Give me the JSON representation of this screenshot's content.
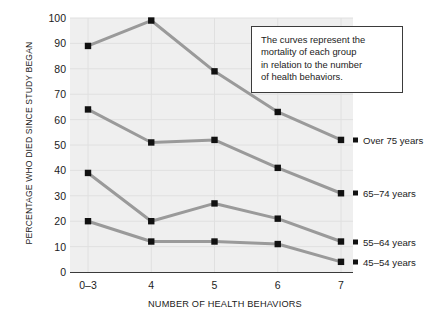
{
  "chart_data": {
    "type": "line",
    "title": "",
    "xlabel": "NUMBER OF HEALTH BEHAVIORS",
    "ylabel": "PERCENTAGE WHO DIED SINCE STUDY BEGAN",
    "categories": [
      "0–3",
      "4",
      "5",
      "6",
      "7"
    ],
    "ylim": [
      0,
      100
    ],
    "yticks": [
      0,
      10,
      20,
      30,
      40,
      50,
      60,
      70,
      80,
      90,
      100
    ],
    "grid": true,
    "legend_position": "inline-right-end-of-series",
    "marker": "square",
    "series": [
      {
        "name": "Over 75 years",
        "values": [
          89,
          99,
          79,
          63,
          52
        ]
      },
      {
        "name": "65–74 years",
        "values": [
          64,
          51,
          52,
          41,
          31
        ]
      },
      {
        "name": "55–64 years",
        "values": [
          39,
          20,
          27,
          21,
          12
        ]
      },
      {
        "name": "45–54 years",
        "values": [
          20,
          12,
          12,
          11,
          4
        ]
      }
    ],
    "annotations": [
      {
        "name": "curves-explanation",
        "lines": [
          "The curves represent the",
          "mortality of each group",
          "in relation to the number",
          "of health behaviors."
        ]
      }
    ],
    "colors": {
      "line": "#9a9a9a",
      "marker": "#111111",
      "plot_background": "#efefef",
      "grid": "#e0e0e0",
      "axis": "#3a3a3a",
      "text": "#1b1b1b",
      "annotation_border": "#3b3b3b",
      "annotation_background": "#ffffff"
    }
  }
}
